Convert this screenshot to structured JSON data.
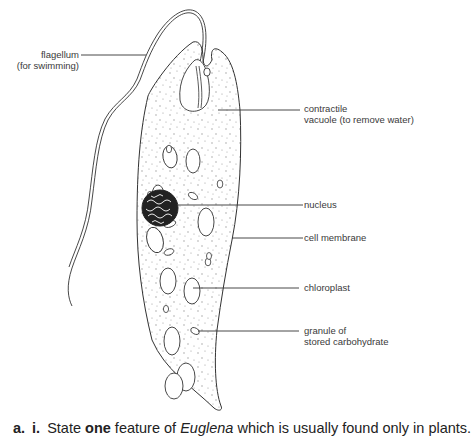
{
  "figure": {
    "subject": "Euglena",
    "labels": {
      "flagellum": [
        "flagellum",
        "(for swimming)"
      ],
      "contractile_vacuole": [
        "contractile",
        "vacuole (to remove water)"
      ],
      "nucleus": [
        "nucleus"
      ],
      "cell_membrane": [
        "cell membrane"
      ],
      "chloroplast": [
        "chloroplast"
      ],
      "granule": [
        "granule of",
        "stored carbohydrate"
      ]
    }
  },
  "question": {
    "part": "a.",
    "subpart": "i.",
    "text_before_bold": "State ",
    "bold": "one",
    "text_middle": " feature of ",
    "italic": "Euglena",
    "text_after": " which is usually found only in plants."
  },
  "colors": {
    "line": "#333333",
    "text": "#3a3a3a",
    "background": "#ffffff"
  }
}
